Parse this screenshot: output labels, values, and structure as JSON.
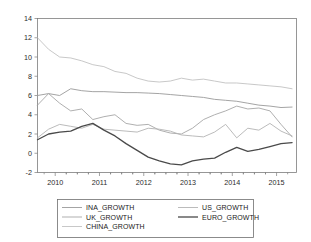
{
  "chart_data": {
    "type": "line",
    "title": "",
    "xlabel": "",
    "ylabel": "",
    "xlim": [
      2009.6,
      2015.45
    ],
    "ylim": [
      -2,
      14
    ],
    "yticks": [
      -2,
      0,
      2,
      4,
      6,
      8,
      10,
      12,
      14
    ],
    "ytick_labels": [
      "-2",
      "0",
      "2",
      "4",
      "6",
      "8",
      "10",
      "12",
      "14"
    ],
    "xticks": [
      2010,
      2011,
      2012,
      2013,
      2014,
      2015
    ],
    "xtick_labels": [
      "2010",
      "2011",
      "2012",
      "2013",
      "2014",
      "2015"
    ],
    "minor_xticks_per_interval": 4,
    "grid": false,
    "legend_position": "below-center",
    "legend_columns": 2,
    "x": [
      2009.6,
      2009.85,
      2010.1,
      2010.35,
      2010.6,
      2010.85,
      2011.1,
      2011.35,
      2011.6,
      2011.85,
      2012.1,
      2012.35,
      2012.6,
      2012.85,
      2013.1,
      2013.35,
      2013.6,
      2013.85,
      2014.1,
      2014.35,
      2014.6,
      2014.85,
      2015.1,
      2015.35
    ],
    "series": [
      {
        "name": "INA_GROWTH",
        "color": "#9a9a9a",
        "width": 0.9,
        "values": [
          6.0,
          6.2,
          6.0,
          6.7,
          6.5,
          6.4,
          6.4,
          6.35,
          6.3,
          6.3,
          6.25,
          6.2,
          6.1,
          6.0,
          5.9,
          5.8,
          5.6,
          5.5,
          5.4,
          5.2,
          5.0,
          4.9,
          4.75,
          4.8
        ]
      },
      {
        "name": "US_GROWTH",
        "color": "#b3b3b3",
        "width": 0.9,
        "values": [
          1.6,
          2.5,
          3.0,
          2.8,
          2.6,
          3.0,
          2.5,
          2.4,
          2.3,
          2.2,
          2.6,
          2.5,
          2.3,
          1.9,
          1.8,
          1.7,
          2.2,
          3.0,
          1.6,
          2.6,
          2.4,
          3.1,
          2.3,
          1.8
        ]
      },
      {
        "name": "UK_GROWTH",
        "color": "#a6a6a6",
        "width": 0.9,
        "values": [
          5.0,
          6.2,
          5.2,
          4.4,
          4.6,
          3.5,
          3.8,
          4.0,
          3.1,
          2.9,
          3.0,
          2.4,
          2.1,
          2.0,
          2.6,
          3.5,
          4.0,
          4.4,
          4.9,
          4.6,
          4.7,
          4.4,
          3.0,
          1.7
        ]
      },
      {
        "name": "EURO_GROWTH",
        "color": "#4a4a4a",
        "width": 1.3,
        "values": [
          1.4,
          2.0,
          2.2,
          2.3,
          2.8,
          3.1,
          2.4,
          1.8,
          1.0,
          0.3,
          -0.4,
          -0.8,
          -1.1,
          -1.2,
          -0.8,
          -0.6,
          -0.5,
          0.1,
          0.6,
          0.2,
          0.4,
          0.7,
          1.0,
          1.1
        ]
      },
      {
        "name": "CHINA_GROWTH",
        "color": "#c2c2c2",
        "width": 0.9,
        "values": [
          12.0,
          10.8,
          10.0,
          9.9,
          9.6,
          9.2,
          9.0,
          8.5,
          8.3,
          7.8,
          7.5,
          7.4,
          7.5,
          7.8,
          7.6,
          7.7,
          7.5,
          7.3,
          7.3,
          7.2,
          7.1,
          7.0,
          6.9,
          6.7
        ]
      }
    ],
    "legend_entries": [
      {
        "label": "INA_GROWTH",
        "color": "#9a9a9a",
        "width": 0.9
      },
      {
        "label": "US_GROWTH",
        "color": "#b3b3b3",
        "width": 0.9
      },
      {
        "label": "UK_GROWTH",
        "color": "#a6a6a6",
        "width": 0.9
      },
      {
        "label": "EURO_GROWTH",
        "color": "#4a4a4a",
        "width": 1.3
      },
      {
        "label": "CHINA_GROWTH",
        "color": "#c2c2c2",
        "width": 0.9
      }
    ]
  }
}
